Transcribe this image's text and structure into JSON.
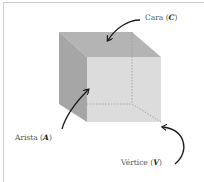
{
  "figure": {
    "colors": {
      "top_face": "#b4b4b4",
      "left_face": "#a6a6a6",
      "front_face": "#dcdcdc",
      "hidden_edges": "#9a9a9a",
      "arrow": "#1a1a1a",
      "frame": "#cfcfcf"
    },
    "labels": {
      "face": {
        "text": "Cara",
        "symbol": "C"
      },
      "edge": {
        "text": "Arista",
        "symbol": "A"
      },
      "vertex": {
        "text": "Vértice",
        "symbol": "V"
      }
    }
  }
}
